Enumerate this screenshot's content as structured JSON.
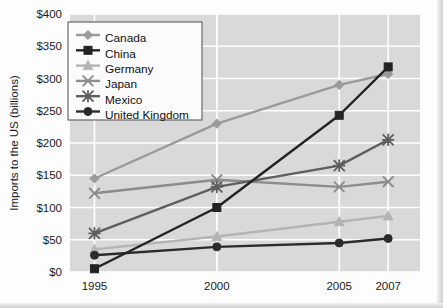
{
  "chart_data": {
    "type": "line",
    "title": "",
    "xlabel": "",
    "ylabel": "Imports to the US (billions)",
    "categories": [
      "1995",
      "2000",
      "2005",
      "2007"
    ],
    "x_positions": [
      1995,
      2000,
      2005,
      2007
    ],
    "ylim": [
      0,
      400
    ],
    "y_ticks": [
      0,
      50,
      100,
      150,
      200,
      250,
      300,
      350,
      400
    ],
    "y_tick_labels": [
      "$0",
      "$50",
      "$100",
      "$150",
      "$200",
      "$250",
      "$300",
      "$350",
      "$400"
    ],
    "grid": true,
    "grid_color": "#ffffff",
    "plot_background": "#d9d9d9",
    "legend_position": "top-left",
    "series": [
      {
        "name": "Canada",
        "values": [
          145,
          230,
          290,
          307
        ],
        "color": "#9a9a9a",
        "marker": "diamond"
      },
      {
        "name": "China",
        "values": [
          5,
          100,
          243,
          318
        ],
        "color": "#232323",
        "marker": "square"
      },
      {
        "name": "Germany",
        "values": [
          35,
          55,
          78,
          87
        ],
        "color": "#b4b4b4",
        "marker": "triangle"
      },
      {
        "name": "Japan",
        "values": [
          122,
          143,
          132,
          140
        ],
        "color": "#8c8c8c",
        "marker": "x"
      },
      {
        "name": "Mexico",
        "values": [
          60,
          132,
          165,
          205
        ],
        "color": "#5e5e5e",
        "marker": "asterisk"
      },
      {
        "name": "United Kingdom",
        "values": [
          26,
          39,
          45,
          52
        ],
        "color": "#2b2b2b",
        "marker": "circle"
      }
    ]
  },
  "legend": {
    "entries": [
      {
        "label": "Canada"
      },
      {
        "label": "China"
      },
      {
        "label": "Germany"
      },
      {
        "label": "Japan"
      },
      {
        "label": "Mexico"
      },
      {
        "label": "United Kingdom"
      }
    ]
  }
}
